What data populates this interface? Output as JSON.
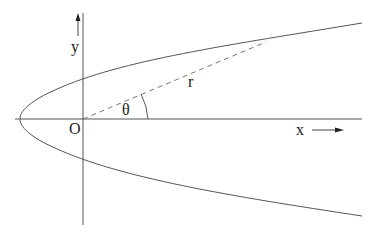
{
  "diagram": {
    "type": "parabola-polar-coordinates",
    "labels": {
      "y_axis": "y",
      "x_axis": "x",
      "origin": "O",
      "angle": "θ",
      "radius": "r"
    },
    "colors": {
      "stroke": "#555555",
      "dashed": "#777777",
      "text": "#222222",
      "background": "#ffffff"
    },
    "elements": [
      "x-axis (horizontal line through origin)",
      "y-axis (vertical line through origin)",
      "parabola opening to the right, vertex left of origin",
      "dashed radius line r from origin O to point on parabola",
      "angle arc θ between x-axis and r",
      "x direction arrow pointing right",
      "y direction arrow pointing up"
    ]
  }
}
